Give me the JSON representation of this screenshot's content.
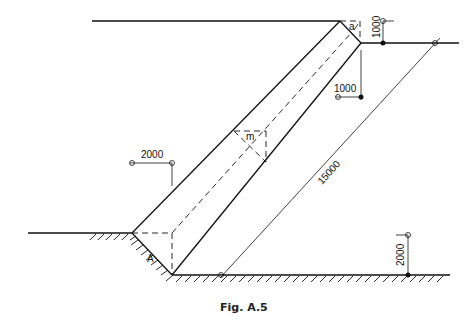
{
  "figure": {
    "caption": "Fig. A.5",
    "labels": {
      "a": "a",
      "m": "m",
      "A": "A"
    },
    "dimensions": {
      "top_right_height": "1000",
      "right_offset": "1000",
      "left_offset": "2000",
      "slope_length": "15000",
      "bottom_right_height": "2000"
    }
  }
}
